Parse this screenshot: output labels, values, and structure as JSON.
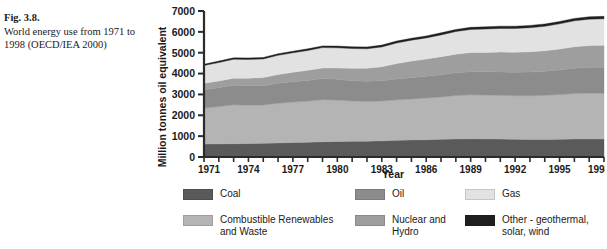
{
  "caption": {
    "figure_label": "Fig. 3.8.",
    "text": "World energy use from 1971 to 1998 (OECD/IEA 2000)"
  },
  "chart_data": {
    "type": "area",
    "stacked": true,
    "title": "",
    "xlabel": "Year",
    "ylabel": "Million tonnes oil equivalent",
    "xlim": [
      1971,
      1998
    ],
    "ylim": [
      0,
      7000
    ],
    "ytick_step": 1000,
    "yticks": [
      0,
      1000,
      2000,
      3000,
      4000,
      5000,
      6000,
      7000
    ],
    "ytick_labels": [
      "0",
      "1000",
      "2000",
      "3000",
      "4000",
      "5000",
      "6000",
      "7000"
    ],
    "xticks_labeled": [
      1971,
      1974,
      1977,
      1980,
      1983,
      1986,
      1989,
      1992,
      1995,
      1998
    ],
    "xtick_labels": [
      "1971",
      "1974",
      "1977",
      "1980",
      "1983",
      "1986",
      "1989",
      "1992",
      "1995",
      "1998"
    ],
    "xticks_minor_every": 1,
    "grid": false,
    "legend_position": "below",
    "x": [
      1971,
      1972,
      1973,
      1974,
      1975,
      1976,
      1977,
      1978,
      1979,
      1980,
      1981,
      1982,
      1983,
      1984,
      1985,
      1986,
      1987,
      1988,
      1989,
      1990,
      1991,
      1992,
      1993,
      1994,
      1995,
      1996,
      1997,
      1998
    ],
    "series": [
      {
        "name": "Coal",
        "color": "#5a5a5a",
        "values": [
          620,
          630,
          640,
          645,
          655,
          675,
          695,
          705,
          730,
          745,
          755,
          760,
          775,
          800,
          820,
          830,
          850,
          865,
          875,
          870,
          860,
          850,
          845,
          845,
          855,
          865,
          870,
          865
        ]
      },
      {
        "name": "Combustible Renewables and Waste",
        "color": "#b4b4b4",
        "values": [
          1730,
          1790,
          1860,
          1840,
          1835,
          1900,
          1940,
          1975,
          2020,
          1985,
          1930,
          1905,
          1905,
          1940,
          1960,
          2000,
          2030,
          2080,
          2105,
          2100,
          2095,
          2090,
          2090,
          2110,
          2140,
          2175,
          2195,
          2185
        ]
      },
      {
        "name": "Oil",
        "color": "#8c8c8c",
        "values": [
          870,
          900,
          935,
          930,
          925,
          955,
          975,
          990,
          1010,
          995,
          975,
          965,
          970,
          1000,
          1020,
          1040,
          1060,
          1090,
          1110,
          1115,
          1120,
          1125,
          1135,
          1155,
          1180,
          1215,
          1240,
          1250
        ]
      },
      {
        "name": "Nuclear and Hydro",
        "color": "#9e9e9e",
        "values": [
          310,
          325,
          345,
          365,
          395,
          420,
          455,
          485,
          510,
          545,
          590,
          625,
          680,
          740,
          800,
          830,
          865,
          895,
          915,
          930,
          955,
          960,
          975,
          985,
          1005,
          1030,
          1040,
          1055
        ]
      },
      {
        "name": "Gas",
        "color": "#e2e2e2",
        "values": [
          855,
          885,
          905,
          900,
          890,
          925,
          930,
          950,
          975,
          965,
          950,
          935,
          945,
          985,
          1000,
          1010,
          1050,
          1085,
          1110,
          1120,
          1135,
          1140,
          1155,
          1170,
          1205,
          1245,
          1260,
          1270
        ]
      },
      {
        "name": "Other - geothermal, solar, wind",
        "color": "#1f1f1f",
        "values": [
          65,
          68,
          70,
          72,
          74,
          76,
          78,
          80,
          82,
          84,
          86,
          88,
          90,
          92,
          94,
          96,
          98,
          100,
          102,
          104,
          106,
          108,
          110,
          112,
          114,
          116,
          118,
          120
        ]
      }
    ],
    "totals": [
      4450,
      4598,
      4755,
      4752,
      4774,
      4951,
      5073,
      5185,
      5327,
      5319,
      5246,
      5238,
      5365,
      5557,
      5694,
      5806,
      5953,
      6115,
      6217,
      6239,
      6271,
      6273,
      6310,
      6377,
      6499,
      6646,
      6723,
      6745
    ]
  },
  "legend": {
    "items": [
      {
        "label": "Coal",
        "color": "#5a5a5a",
        "col": 0,
        "row": 0
      },
      {
        "label": "Combustible Renewables\nand Waste",
        "color": "#b4b4b4",
        "col": 0,
        "row": 1
      },
      {
        "label": "Oil",
        "color": "#8c8c8c",
        "col": 1,
        "row": 0
      },
      {
        "label": "Nuclear and\nHydro",
        "color": "#9e9e9e",
        "col": 1,
        "row": 1
      },
      {
        "label": "Gas",
        "color": "#e2e2e2",
        "col": 2,
        "row": 0
      },
      {
        "label": "Other - geothermal,\nsolar, wind",
        "color": "#1f1f1f",
        "col": 2,
        "row": 1
      }
    ]
  }
}
